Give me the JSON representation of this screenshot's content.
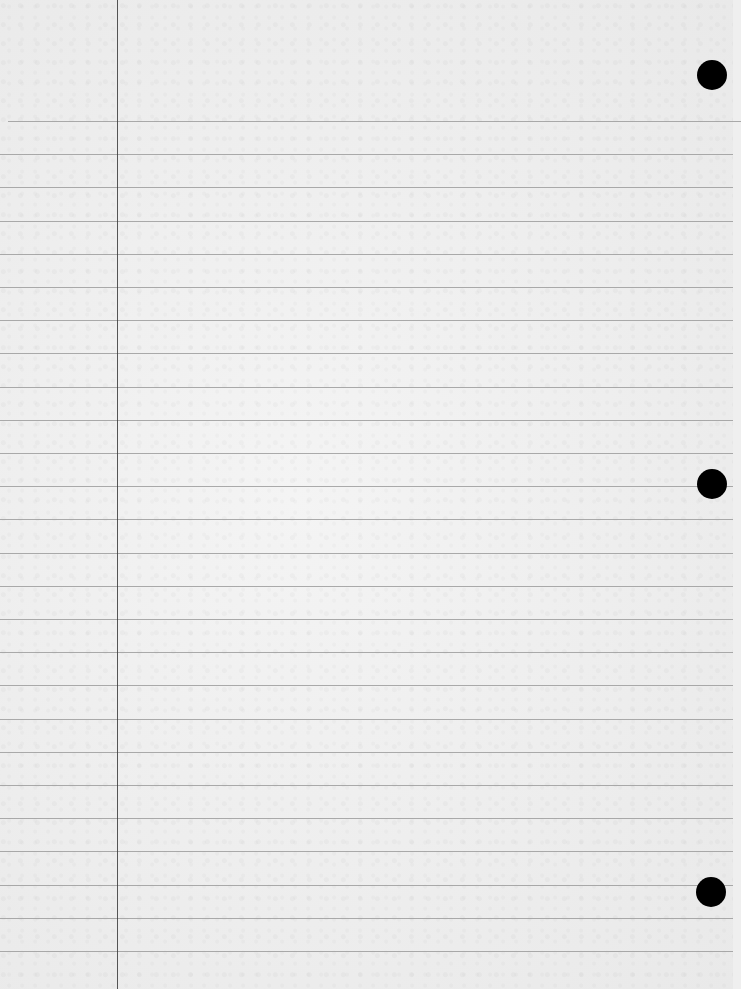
{
  "page": {
    "type": "lined-notebook-paper",
    "ruled_line_count": 26,
    "punch_hole_count": 3,
    "content_text": "",
    "colors": {
      "paper": "#efefef",
      "rule_line": "#9c9c9c",
      "margin_line": "#3a3a3a",
      "punch_hole": "#000000"
    }
  }
}
